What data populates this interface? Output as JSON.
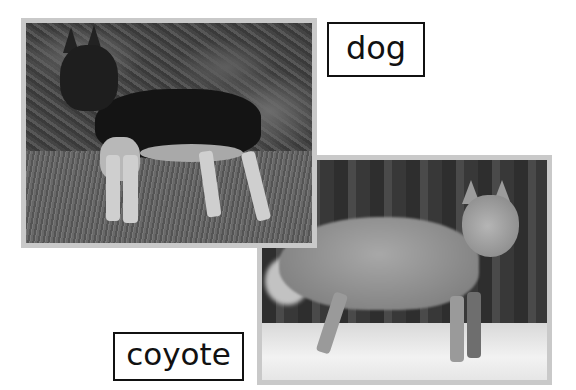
{
  "cards": [
    {
      "id": "dog",
      "label": "dog",
      "photo_subject": "German shepherd dog standing on grass in front of foliage (grayscale)"
    },
    {
      "id": "coyote",
      "label": "coyote",
      "photo_subject": "Coyote standing in snow in front of dark trees (grayscale)"
    }
  ],
  "colors": {
    "background": "#ffffff",
    "frame_border": "#c9c9c9",
    "label_border": "#111111",
    "label_text": "#111111"
  }
}
